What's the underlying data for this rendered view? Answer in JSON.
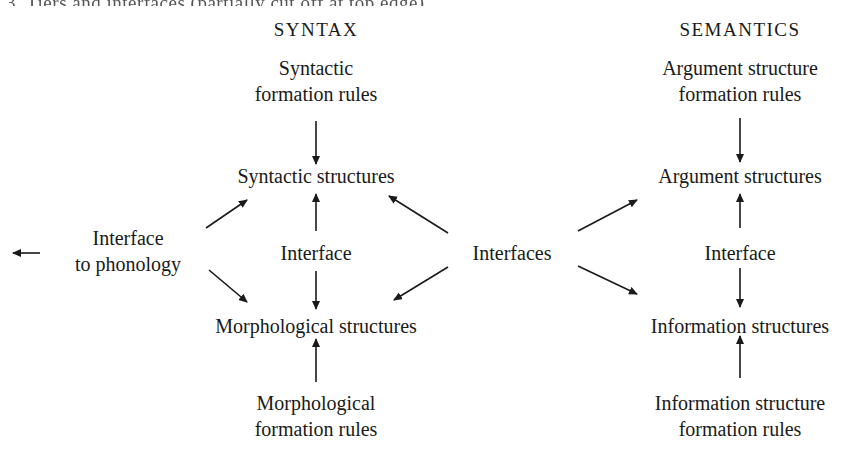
{
  "caption_cutoff": "3. Tiers and interfaces (partially cut off at top edge)",
  "columns": {
    "syntax": {
      "heading": "SYNTAX",
      "formation_rules": [
        "Syntactic",
        "formation rules"
      ],
      "structures": "Syntactic structures",
      "interface": "Interface",
      "lower_structures": "Morphological structures",
      "lower_formation_rules": [
        "Morphological",
        "formation rules"
      ]
    },
    "semantics": {
      "heading": "SEMANTICS",
      "formation_rules": [
        "Argument structure",
        "formation rules"
      ],
      "structures": "Argument structures",
      "interface": "Interface",
      "lower_structures": "Information structures",
      "lower_formation_rules": [
        "Information structure",
        "formation rules"
      ]
    }
  },
  "left_node": [
    "Interface",
    "to phonology"
  ],
  "center_node": "Interfaces",
  "arrow_color": "#1a1a1a",
  "edges": [
    {
      "from": "Syntactic formation rules",
      "to": "Syntactic structures"
    },
    {
      "from": "Interface (syntax)",
      "to": "Syntactic structures"
    },
    {
      "from": "Interface (syntax)",
      "to": "Morphological structures"
    },
    {
      "from": "Morphological formation rules",
      "to": "Morphological structures"
    },
    {
      "from": "Interface to phonology",
      "to": "Syntactic structures"
    },
    {
      "from": "Interface to phonology",
      "to": "Morphological structures"
    },
    {
      "from": "Interface to phonology",
      "to": "off-left (phonology)"
    },
    {
      "from": "Interfaces",
      "to": "Syntactic structures"
    },
    {
      "from": "Interfaces",
      "to": "Morphological structures"
    },
    {
      "from": "Interfaces",
      "to": "Argument structures"
    },
    {
      "from": "Interfaces",
      "to": "Information structures"
    },
    {
      "from": "Argument structure formation rules",
      "to": "Argument structures"
    },
    {
      "from": "Interface (semantics)",
      "to": "Argument structures"
    },
    {
      "from": "Interface (semantics)",
      "to": "Information structures"
    },
    {
      "from": "Information structure formation rules",
      "to": "Information structures"
    }
  ]
}
